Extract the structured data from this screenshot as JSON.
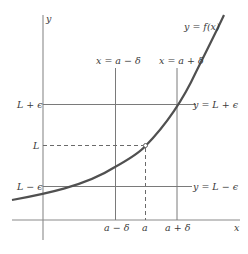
{
  "diagram": {
    "colors": {
      "axis": "#8a8a8a",
      "grid_line": "#7a7a7a",
      "curve": "#505050",
      "text": "#3a3a3a",
      "background": "#ffffff"
    },
    "axes": {
      "x_label": "x",
      "y_label": "y"
    },
    "curve_label": "y = f(x)",
    "vertical_lines": [
      {
        "id": "a-minus-delta",
        "label": "x = a − δ",
        "tick_label": "a − δ"
      },
      {
        "id": "a",
        "label": "",
        "tick_label": "a",
        "dashed": true
      },
      {
        "id": "a-plus-delta",
        "label": "x = a + δ",
        "tick_label": "a + δ"
      }
    ],
    "horizontal_lines": [
      {
        "id": "L-plus-eps",
        "label": "y = L + ϵ",
        "tick_label": "L + ϵ"
      },
      {
        "id": "L",
        "label": "",
        "tick_label": "L",
        "dashed": true
      },
      {
        "id": "L-minus-eps",
        "label": "y = L − ϵ",
        "tick_label": "L − ϵ"
      }
    ],
    "point": {
      "label": "(a, L)",
      "style": "open-circle"
    }
  }
}
